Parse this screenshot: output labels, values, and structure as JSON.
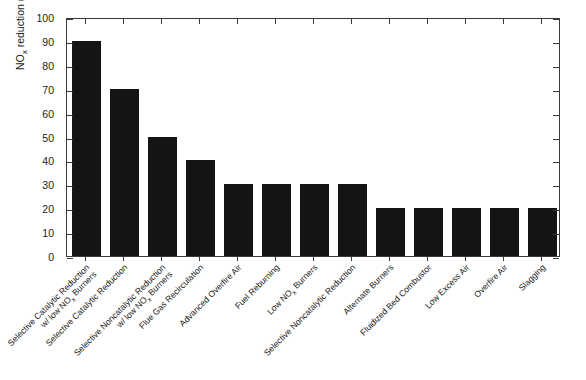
{
  "chart_data": {
    "type": "bar",
    "title": "",
    "xlabel": "",
    "ylabel": "NO_x reduction (%)",
    "ylabel_prefix": "NO",
    "ylabel_sub": "x",
    "ylabel_suffix": " reduction (%)",
    "ylim": [
      0,
      100
    ],
    "yticks": [
      0,
      10,
      20,
      30,
      40,
      50,
      60,
      70,
      80,
      90,
      100
    ],
    "ytick_labels": [
      "0",
      "10",
      "20",
      "30",
      "40",
      "50",
      "60",
      "70",
      "80",
      "90",
      "100"
    ],
    "grid": false,
    "legend": null,
    "bar_color": "#141414",
    "axis_color": "#3a3a3a",
    "categories": [
      "Selective Catalytic Reduction w/ low NOx Burners",
      "Selective Catalytic Reduction",
      "Selective Noncatalytic Reduction w/ low NOx Burners",
      "Flue Gas Recirculation",
      "Advanced Overfire Air",
      "Fuel Reburning",
      "Low NOx Burners",
      "Selective Noncatalytic Reduction",
      "Alternate Burners",
      "Fluidized Bed Combustor",
      "Low Excess Air",
      "Overfire Air",
      "Slagging"
    ],
    "values": [
      90,
      70,
      50,
      40,
      30,
      30,
      30,
      30,
      20,
      20,
      20,
      20,
      20
    ],
    "tick_labels": [
      {
        "line1": "Selective Catalytic Reduction",
        "line2_pre": "w/ low NO",
        "line2_sub": "x",
        "line2_post": " Burners"
      },
      {
        "line1": "Selective Catalytic Reduction",
        "line2_pre": "",
        "line2_sub": "",
        "line2_post": ""
      },
      {
        "line1": "Selective Noncatalytic Reduction",
        "line2_pre": "w/ low NO",
        "line2_sub": "x",
        "line2_post": " Burners"
      },
      {
        "line1": "Flue Gas Recirculation",
        "line2_pre": "",
        "line2_sub": "",
        "line2_post": ""
      },
      {
        "line1": "Advanced Overfire Air",
        "line2_pre": "",
        "line2_sub": "",
        "line2_post": ""
      },
      {
        "line1": "Fuel Reburning",
        "line2_pre": "",
        "line2_sub": "",
        "line2_post": ""
      },
      {
        "line1_pre": "Low NO",
        "line1_sub": "x",
        "line1_post": " Burners",
        "line1": "",
        "line2_pre": "",
        "line2_sub": "",
        "line2_post": ""
      },
      {
        "line1": "Selective Noncatalytic Reduction",
        "line2_pre": "",
        "line2_sub": "",
        "line2_post": ""
      },
      {
        "line1": "Alternate Burners",
        "line2_pre": "",
        "line2_sub": "",
        "line2_post": ""
      },
      {
        "line1": "Fluidized Bed Combustor",
        "line2_pre": "",
        "line2_sub": "",
        "line2_post": ""
      },
      {
        "line1": "Low Excess Air",
        "line2_pre": "",
        "line2_sub": "",
        "line2_post": ""
      },
      {
        "line1": "Overfire Air",
        "line2_pre": "",
        "line2_sub": "",
        "line2_post": ""
      },
      {
        "line1": "Slagging",
        "line2_pre": "",
        "line2_sub": "",
        "line2_post": ""
      }
    ]
  },
  "caption": {
    "text": ""
  }
}
